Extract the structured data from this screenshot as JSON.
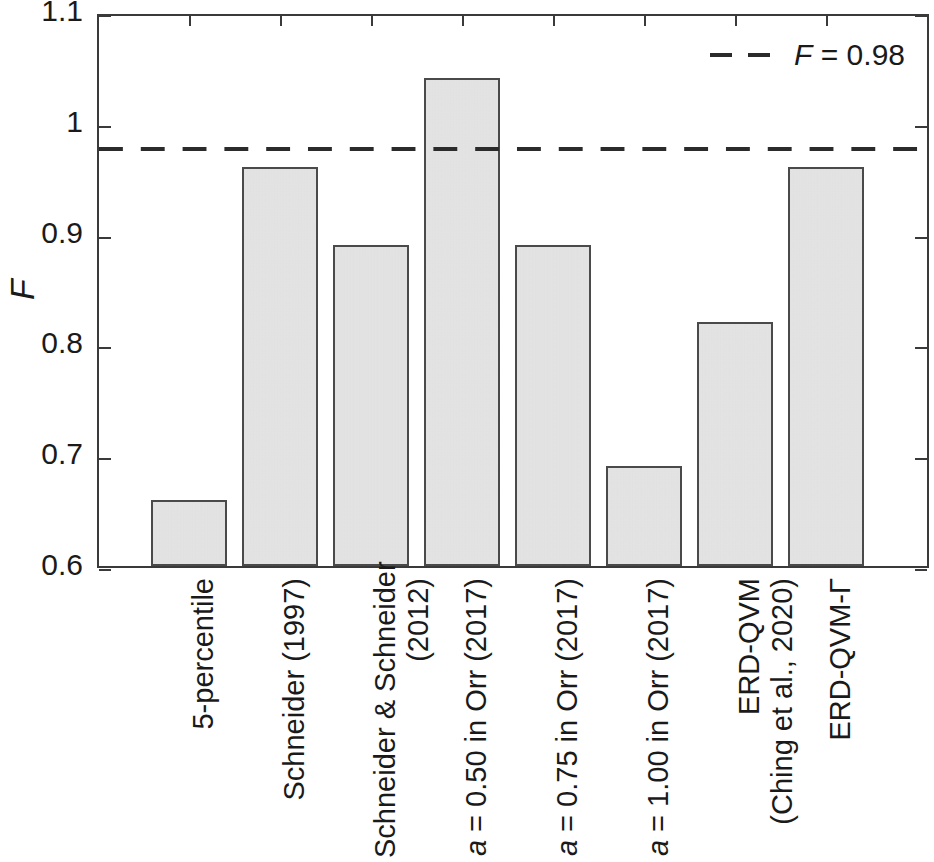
{
  "chart_data": {
    "type": "bar",
    "title": "",
    "xlabel": "",
    "ylabel": "F",
    "ylim": [
      0.6,
      1.1
    ],
    "ytick_labels": [
      "0.6",
      "0.7",
      "0.8",
      "0.9",
      "1",
      "1.1"
    ],
    "ytick_values": [
      0.6,
      0.7,
      0.8,
      0.9,
      1.0,
      1.1
    ],
    "grid": false,
    "legend_position": "top-right",
    "categories": [
      "5-percentile",
      "Schneider (1997)",
      "Schneider & Schneider (2012)",
      "a = 0.50 in Orr (2017)",
      "a = 0.75 in Orr (2017)",
      "a = 1.00 in Orr (2017)",
      "ERD-QVM (Ching et al., 2020)",
      "ERD-QVM-Γ"
    ],
    "category_lines": [
      [
        "5-percentile"
      ],
      [
        "Schneider (1997)"
      ],
      [
        "Schneider & Schneider",
        "(2012)"
      ],
      [
        "a = 0.50 in Orr (2017)"
      ],
      [
        "a = 0.75 in Orr (2017)"
      ],
      [
        "a = 1.00 in Orr (2017)"
      ],
      [
        "ERD-QVM",
        "(Ching et al., 2020)"
      ],
      [
        "ERD-QVM-Γ"
      ]
    ],
    "values": [
      0.66,
      0.96,
      0.89,
      1.04,
      0.89,
      0.69,
      0.82,
      0.96
    ],
    "bar_fill_color": "#e9e9e9",
    "bar_edge_color": "#4a4a4a",
    "annotations": [
      {
        "type": "reference_line",
        "style": "dashed",
        "value": 0.98,
        "label": "F = 0.98",
        "color": "#2b2b2b"
      }
    ],
    "legend": [
      {
        "label": "F = 0.98",
        "label_italic_prefix": "F",
        "label_rest": " = 0.98",
        "style": "dashed",
        "color": "#2b2b2b"
      }
    ]
  },
  "axis": {
    "ylabel_text": "F"
  }
}
